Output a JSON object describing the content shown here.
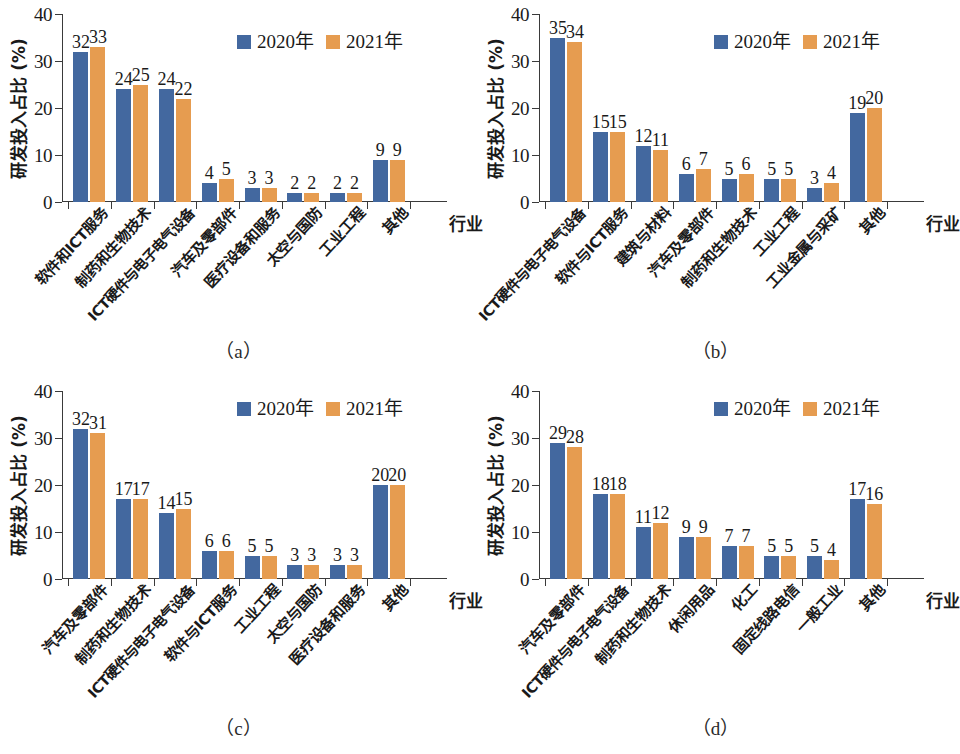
{
  "figure": {
    "background": "#ffffff",
    "colors": {
      "series_2020": "#43689f",
      "series_2021": "#e69c50",
      "axis": "#3a3a3a",
      "text": "#1a1a1a"
    },
    "captions": {
      "a": "（a）",
      "b": "（b）",
      "c": "（c）",
      "d": "（d）"
    }
  },
  "common": {
    "ylabel": "研发投入占比 (%)",
    "xlabel": "行业",
    "yticks": [
      "0",
      "10",
      "20",
      "30",
      "40"
    ],
    "legend": [
      {
        "label": "2020年",
        "color": "#43689f"
      },
      {
        "label": "2021年",
        "color": "#e69c50"
      }
    ]
  },
  "chart_data": [
    {
      "id": "a",
      "type": "bar",
      "title": "（a）",
      "xlabel": "行业",
      "ylabel": "研发投入占比 (%)",
      "ylim": [
        0,
        40
      ],
      "yticks": [
        0,
        10,
        20,
        30,
        40
      ],
      "grid": false,
      "legend_position": "top-right",
      "categories": [
        "软件和ICT服务",
        "制药和生物技术",
        "ICT硬件与电子电气设备",
        "汽车及零部件",
        "医疗设备和服务",
        "太空与国防",
        "工业工程",
        "其他"
      ],
      "series": [
        {
          "name": "2020年",
          "color": "#43689f",
          "values": [
            32,
            24,
            24,
            4,
            3,
            2,
            2,
            9
          ]
        },
        {
          "name": "2021年",
          "color": "#e69c50",
          "values": [
            33,
            25,
            22,
            5,
            3,
            2,
            2,
            9
          ]
        }
      ]
    },
    {
      "id": "b",
      "type": "bar",
      "title": "（b）",
      "xlabel": "行业",
      "ylabel": "研发投入占比 (%)",
      "ylim": [
        0,
        40
      ],
      "yticks": [
        0,
        10,
        20,
        30,
        40
      ],
      "grid": false,
      "legend_position": "top-right",
      "categories": [
        "ICT硬件与电子电气设备",
        "软件与ICT服务",
        "建筑与材料",
        "汽车及零部件",
        "制药和生物技术",
        "工业工程",
        "工业金属与采矿",
        "其他"
      ],
      "series": [
        {
          "name": "2020年",
          "color": "#43689f",
          "values": [
            35,
            15,
            12,
            6,
            5,
            5,
            3,
            19
          ]
        },
        {
          "name": "2021年",
          "color": "#e69c50",
          "values": [
            34,
            15,
            11,
            7,
            6,
            5,
            4,
            20
          ]
        }
      ]
    },
    {
      "id": "c",
      "type": "bar",
      "title": "（c）",
      "xlabel": "行业",
      "ylabel": "研发投入占比 (%)",
      "ylim": [
        0,
        40
      ],
      "yticks": [
        0,
        10,
        20,
        30,
        40
      ],
      "grid": false,
      "legend_position": "top-right",
      "categories": [
        "汽车及零部件",
        "制药和生物技术",
        "ICT硬件与电子电气设备",
        "软件与ICT服务",
        "工业工程",
        "太空与国防",
        "医疗设备和服务",
        "其他"
      ],
      "series": [
        {
          "name": "2020年",
          "color": "#43689f",
          "values": [
            32,
            17,
            14,
            6,
            5,
            3,
            3,
            20
          ]
        },
        {
          "name": "2021年",
          "color": "#e69c50",
          "values": [
            31,
            17,
            15,
            6,
            5,
            3,
            3,
            20
          ]
        }
      ]
    },
    {
      "id": "d",
      "type": "bar",
      "title": "（d）",
      "xlabel": "行业",
      "ylabel": "研发投入占比 (%)",
      "ylim": [
        0,
        40
      ],
      "yticks": [
        0,
        10,
        20,
        30,
        40
      ],
      "grid": false,
      "legend_position": "top-right",
      "categories": [
        "汽车及零部件",
        "ICT硬件与电子电气设备",
        "制药和生物技术",
        "休闲用品",
        "化工",
        "固定线路电信",
        "一般工业",
        "其他"
      ],
      "series": [
        {
          "name": "2020年",
          "color": "#43689f",
          "values": [
            29,
            18,
            11,
            9,
            7,
            5,
            5,
            17
          ]
        },
        {
          "name": "2021年",
          "color": "#e69c50",
          "values": [
            28,
            18,
            12,
            9,
            7,
            5,
            4,
            16
          ]
        }
      ]
    }
  ]
}
